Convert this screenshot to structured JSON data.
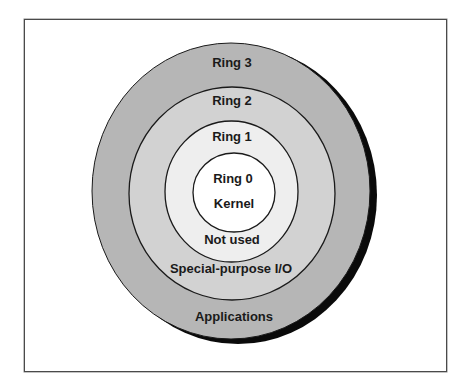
{
  "diagram": {
    "type": "concentric-rings",
    "colors": {
      "ring3": "#b6b6b6",
      "ring2": "#d2d2d2",
      "ring1": "#eeeeee",
      "ring0": "#ffffff",
      "outline": "#1a1a1a",
      "shadow": "#0a0a0a"
    },
    "rings": [
      {
        "name": "Ring 3",
        "usage": "Applications"
      },
      {
        "name": "Ring 2",
        "usage": "Special-purpose I/O"
      },
      {
        "name": "Ring 1",
        "usage": "Not used"
      },
      {
        "name": "Ring 0",
        "usage": "Kernel"
      }
    ]
  }
}
